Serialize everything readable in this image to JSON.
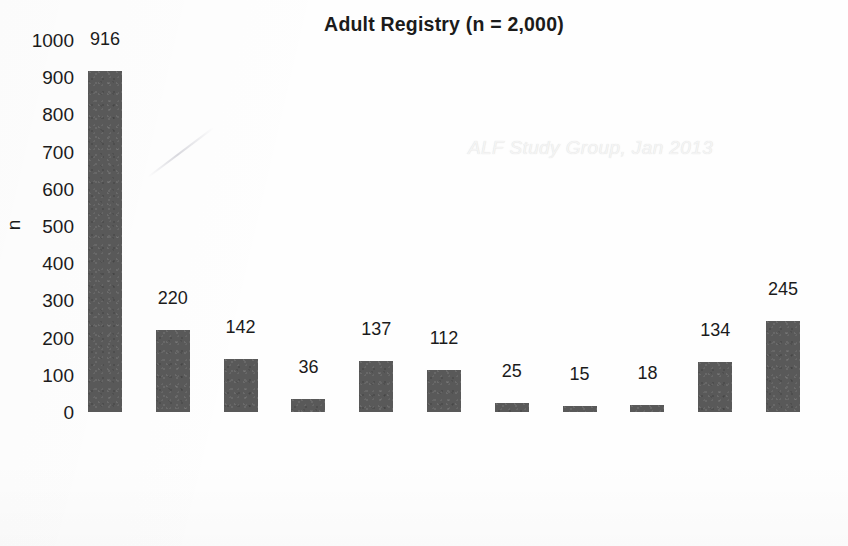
{
  "chart_data": {
    "type": "bar",
    "title": "Adult Registry  (n = 2,000)",
    "xlabel": "",
    "ylabel": "n",
    "ylim": [
      0,
      1000
    ],
    "ytick_step": 100,
    "yticks": [
      1000,
      900,
      800,
      700,
      600,
      500,
      400,
      300,
      200,
      100,
      0
    ],
    "grid": false,
    "legend": null,
    "bar_color": "#595959",
    "categories": [
      "APAP",
      "Drug",
      "Hep B",
      "Hep A",
      "Autoimm",
      "Ischemic",
      "Wilson's",
      "Budd-Chiari",
      "Pregnancy",
      "Other",
      "Indeter"
    ],
    "values": [
      916,
      220,
      142,
      36,
      137,
      112,
      25,
      15,
      18,
      134,
      245
    ],
    "data_labels": [
      "916",
      "220",
      "142",
      "36",
      "137",
      "112",
      "25",
      "15",
      "18",
      "134",
      "245"
    ],
    "annotations": [
      {
        "text": "ALF Study Group, Jan 2013",
        "kind": "watermark"
      }
    ]
  },
  "watermark": {
    "text": "ALF Study Group, Jan 2013"
  }
}
